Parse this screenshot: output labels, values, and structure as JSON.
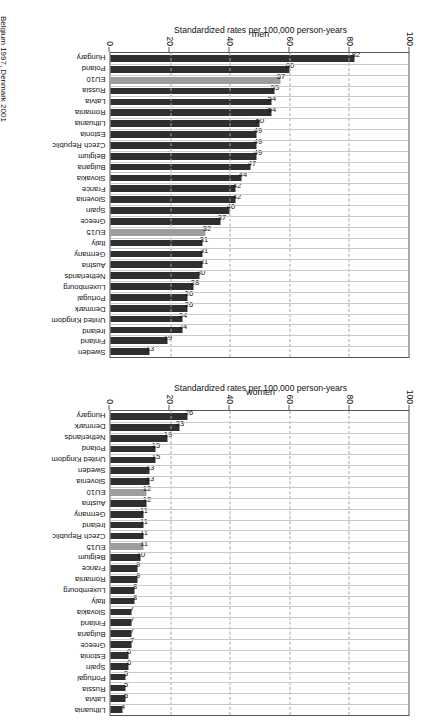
{
  "figure": {
    "footnote": "Belgium 1997, Denmark 2001",
    "axis_title": "Standardized rates per 100,000 person-years",
    "bar_color": "#2f2f2f",
    "eu_bar_color": "#9d9d9d"
  },
  "chart_data": [
    {
      "type": "bar",
      "title": "men",
      "xlabel": "",
      "ylabel": "Standardized rates per 100,000 person-years",
      "ylim": [
        0,
        100
      ],
      "yticks": [
        0,
        20,
        40,
        60,
        80,
        100
      ],
      "grid": true,
      "orientation": "vertical",
      "highlight_categories": [
        "EU10",
        "EU15"
      ],
      "categories": [
        "Hungary",
        "Poland",
        "EU10",
        "Russia",
        "Latvia",
        "Romania",
        "Lithuania",
        "Estonia",
        "Czech Republic",
        "Belgium",
        "Bulgaria",
        "Slovakia",
        "France",
        "Slovenia",
        "Spain",
        "Greece",
        "EU15",
        "Italy",
        "Germany",
        "Austria",
        "Netherlands",
        "Luxembourg",
        "Portugal",
        "Denmark",
        "United Kingdom",
        "Ireland",
        "Finland",
        "Sweden"
      ],
      "values": [
        82,
        60,
        57,
        55,
        54,
        54,
        50,
        49,
        49,
        49,
        47,
        44,
        42,
        42,
        40,
        37,
        32,
        31,
        31,
        31,
        30,
        28,
        26,
        26,
        24,
        24,
        19,
        13
      ]
    },
    {
      "type": "bar",
      "title": "women",
      "xlabel": "",
      "ylabel": "Standardized rates per 100,000 person-years",
      "ylim": [
        0,
        100
      ],
      "yticks": [
        0,
        20,
        40,
        60,
        80,
        100
      ],
      "grid": true,
      "orientation": "vertical",
      "highlight_categories": [
        "EU10",
        "EU15"
      ],
      "categories": [
        "Hungary",
        "Denmark",
        "Netherlands",
        "Poland",
        "United Kingdom",
        "Sweden",
        "Slovenia",
        "EU10",
        "Austria",
        "Germany",
        "Ireland",
        "Czech Republic",
        "EU15",
        "Belgium",
        "France",
        "Romania",
        "Luxembourg",
        "Italy",
        "Slovakia",
        "Finland",
        "Bulgaria",
        "Greece",
        "Estonia",
        "Spain",
        "Portugal",
        "Russia",
        "Latvia",
        "Lithuania"
      ],
      "values": [
        26,
        23,
        19,
        15,
        15,
        13,
        13,
        12,
        12,
        11,
        11,
        11,
        11,
        10,
        9,
        9,
        8,
        8,
        7,
        7,
        7,
        7,
        6,
        6,
        5,
        5,
        5,
        4
      ]
    }
  ]
}
